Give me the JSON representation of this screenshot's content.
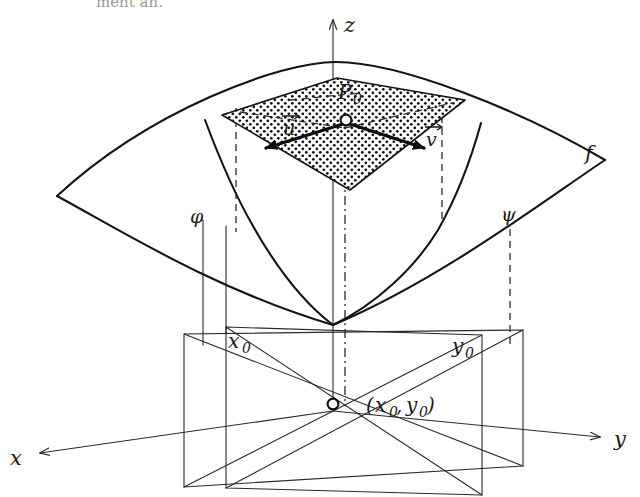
{
  "figure": {
    "caption_fragment": "ment an.",
    "surface_label": "f",
    "point_label": "P",
    "point_subscript": "0",
    "axes": {
      "x": "x",
      "y": "y",
      "z": "z"
    },
    "curves": [
      {
        "name": "phi-curve",
        "label": "φ"
      },
      {
        "name": "psi-curve",
        "label": "ψ"
      }
    ],
    "vectors": [
      {
        "name": "u-vector",
        "label": "u⃗",
        "glyph": "u",
        "direction": "left-down"
      },
      {
        "name": "v-vector",
        "label": "v⃗",
        "glyph": "v",
        "direction": "right-down"
      }
    ],
    "base_point": {
      "open_paren": "(",
      "x_symbol": "x",
      "x_subscript": "0",
      "comma": ",",
      "y_symbol": "y",
      "y_subscript": "0",
      "close_paren": ")"
    },
    "trace_labels": [
      {
        "name": "x0-label",
        "symbol": "x",
        "subscript": "0"
      },
      {
        "name": "y0-label",
        "symbol": "y",
        "subscript": "0"
      }
    ],
    "colors": {
      "ink": "#141414",
      "thin_ink": "#2a2a2a",
      "background": "#ffffff",
      "stipple": "#101010"
    }
  }
}
